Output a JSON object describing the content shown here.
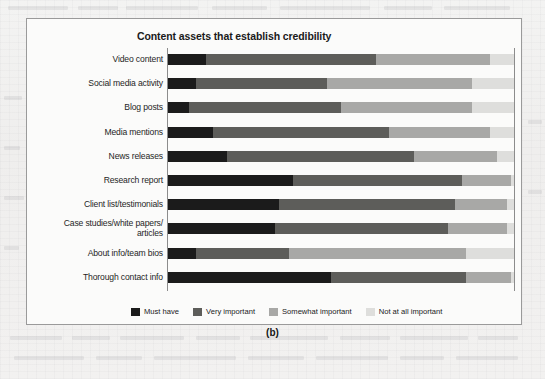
{
  "figure": {
    "caption": "(b)"
  },
  "chart_data": {
    "type": "bar",
    "subtype": "stacked-horizontal-100pct",
    "title": "Content assets that establish credibility",
    "xlabel": "",
    "ylabel": "",
    "xlim": [
      0,
      100
    ],
    "grid": false,
    "legend_position": "bottom",
    "categories": [
      "Video content",
      "Social media activity",
      "Blog posts",
      "Media mentions",
      "News releases",
      "Research report",
      "Client list/testimonials",
      "Case studies/white papers/\narticles",
      "About info/team bios",
      "Thorough contact info"
    ],
    "series": [
      {
        "name": "Must have",
        "color": "#1b1b1b",
        "values": [
          11,
          8,
          6,
          13,
          17,
          36,
          32,
          31,
          8,
          47
        ]
      },
      {
        "name": "Very important",
        "color": "#5d5d5a",
        "values": [
          49,
          38,
          44,
          51,
          54,
          49,
          51,
          50,
          27,
          39
        ]
      },
      {
        "name": "Somewhat important",
        "color": "#a8a8a6",
        "values": [
          33,
          42,
          38,
          29,
          24,
          14,
          15,
          17,
          51,
          13
        ]
      },
      {
        "name": "Not at all important",
        "color": "#dededc",
        "values": [
          7,
          12,
          12,
          7,
          5,
          1,
          2,
          2,
          14,
          1
        ]
      }
    ],
    "legend": [
      {
        "label": "Must have",
        "color": "#1b1b1b"
      },
      {
        "label": "Very important",
        "color": "#5d5d5a"
      },
      {
        "label": "Somewhat important",
        "color": "#a8a8a6"
      },
      {
        "label": "Not at all important",
        "color": "#dededc"
      }
    ]
  }
}
